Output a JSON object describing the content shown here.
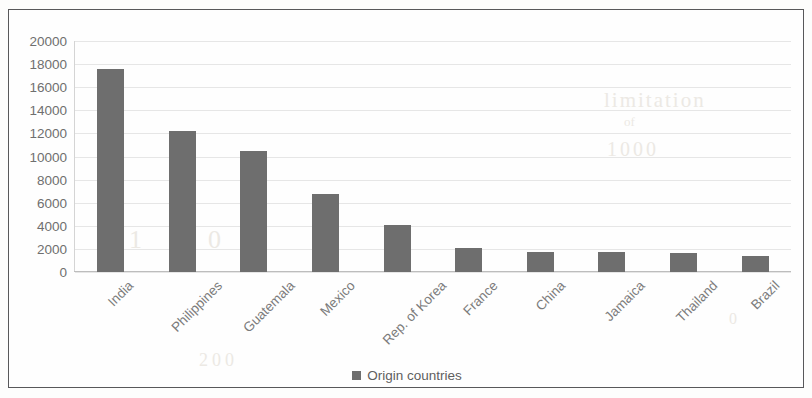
{
  "chart_data": {
    "type": "bar",
    "title": "",
    "xlabel": "",
    "ylabel": "",
    "categories": [
      "India",
      "Philippines",
      "Guatemala",
      "Mexico",
      "Rep. of Korea",
      "France",
      "China",
      "Jamaica",
      "Thailand",
      "Brazil"
    ],
    "values": [
      17600,
      12250,
      10450,
      6750,
      4050,
      2050,
      1700,
      1700,
      1650,
      1400
    ],
    "series": [
      {
        "name": "Origin countries",
        "values": [
          17600,
          12250,
          10450,
          6750,
          4050,
          2050,
          1700,
          1700,
          1650,
          1400
        ],
        "color": "#6e6e6e"
      }
    ],
    "ylim": [
      0,
      20000
    ],
    "ytick_labels": [
      "20000",
      "18000",
      "16000",
      "14000",
      "12000",
      "10000",
      "8000",
      "6000",
      "4000",
      "2000",
      "0"
    ],
    "ytick_values": [
      20000,
      18000,
      16000,
      14000,
      12000,
      10000,
      8000,
      6000,
      4000,
      2000,
      0
    ],
    "grid": true,
    "legend_position": "bottom",
    "legend": [
      "Origin countries"
    ],
    "bar_color": "#6e6e6e",
    "xlabel_rotation": -45
  },
  "legend": {
    "label": "Origin countries"
  },
  "background_artifacts": {
    "m1": "limitation",
    "m2": "of",
    "m3": "1000",
    "m4": "1 0 0 0",
    "m5": "200",
    "m6": "0"
  }
}
